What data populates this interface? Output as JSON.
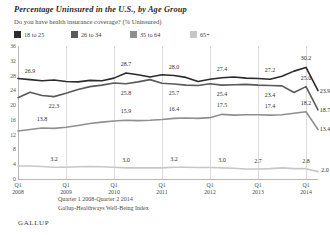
{
  "chart_data": {
    "type": "line",
    "title": "Percentage Uninsured in the U.S., by Age Group",
    "subtitle": "Do you have health insurance coverage? (% Uninsured)",
    "xlabel": "",
    "ylabel": "",
    "ylim": [
      0,
      36
    ],
    "yticks": [
      0,
      4,
      8,
      12,
      16,
      20,
      24,
      28,
      32,
      36
    ],
    "grid": "vertical",
    "legend_position": "top-left",
    "x": [
      "Q1 2008",
      "Q2 2008",
      "Q3 2008",
      "Q4 2008",
      "Q1 2009",
      "Q2 2009",
      "Q3 2009",
      "Q4 2009",
      "Q1 2010",
      "Q2 2010",
      "Q3 2010",
      "Q4 2010",
      "Q1 2011",
      "Q2 2011",
      "Q3 2011",
      "Q4 2011",
      "Q1 2012",
      "Q2 2012",
      "Q3 2012",
      "Q4 2012",
      "Q1 2013",
      "Q2 2013",
      "Q3 2013",
      "Q4 2013",
      "Q1 2014",
      "Q2 2014"
    ],
    "xtick_labels": [
      {
        "q": "Q1",
        "year": "2008"
      },
      {
        "q": "Q1",
        "year": "2009"
      },
      {
        "q": "Q1",
        "year": "2010"
      },
      {
        "q": "Q1",
        "year": "2011"
      },
      {
        "q": "Q1",
        "year": "2012"
      },
      {
        "q": "Q1",
        "year": "2013"
      },
      {
        "q": "Q1",
        "year": "2014"
      }
    ],
    "series": [
      {
        "name": "18 to 25",
        "color": "#2b2b2b",
        "values": [
          27.2,
          26.9,
          26.6,
          26.8,
          26.4,
          26.3,
          26.7,
          26.6,
          27.3,
          28.7,
          28.2,
          27.6,
          28.2,
          28.0,
          27.5,
          26.4,
          27.0,
          27.4,
          27.6,
          27.3,
          27.2,
          27.0,
          27.8,
          29.2,
          30.2,
          23.9
        ]
      },
      {
        "name": "26 to 34",
        "color": "#5a5a5a",
        "values": [
          22.0,
          23.5,
          22.6,
          22.3,
          23.2,
          24.2,
          25.0,
          25.4,
          26.0,
          25.8,
          26.3,
          26.9,
          25.9,
          25.7,
          25.4,
          25.3,
          25.8,
          25.4,
          25.5,
          25.6,
          25.4,
          25.3,
          25.2,
          23.4,
          25.0,
          18.7
        ]
      },
      {
        "name": "35 to 64",
        "color": "#8f8f8f",
        "values": [
          13.0,
          13.4,
          13.8,
          13.7,
          14.0,
          14.5,
          15.0,
          15.4,
          15.7,
          15.9,
          15.8,
          15.9,
          16.1,
          16.4,
          16.5,
          16.4,
          16.6,
          17.5,
          17.3,
          17.4,
          17.4,
          17.3,
          17.4,
          17.8,
          18.2,
          13.4
        ]
      },
      {
        "name": "65+",
        "color": "#c7c7c7",
        "values": [
          3.5,
          3.5,
          3.4,
          3.2,
          3.2,
          3.3,
          3.4,
          3.3,
          3.2,
          3.0,
          3.0,
          3.0,
          3.0,
          3.2,
          3.2,
          3.1,
          3.1,
          3.0,
          2.9,
          2.7,
          2.7,
          2.8,
          3.0,
          2.8,
          2.8,
          2.0
        ]
      }
    ],
    "point_labels": [
      {
        "series": "18 to 25",
        "index": 1,
        "value": "26.9",
        "dx": 0,
        "dy": -9
      },
      {
        "series": "18 to 25",
        "index": 9,
        "value": "28.7",
        "dx": 0,
        "dy": -9
      },
      {
        "series": "18 to 25",
        "index": 13,
        "value": "28.0",
        "dx": 0,
        "dy": -9
      },
      {
        "series": "18 to 25",
        "index": 17,
        "value": "27.4",
        "dx": 0,
        "dy": -9
      },
      {
        "series": "18 to 25",
        "index": 21,
        "value": "27.2",
        "dx": 0,
        "dy": -9
      },
      {
        "series": "18 to 25",
        "index": 24,
        "value": "30.2",
        "dx": 0,
        "dy": -9
      },
      {
        "series": "18 to 25",
        "index": 25,
        "value": "23.9",
        "dx": 7,
        "dy": 0
      },
      {
        "series": "26 to 34",
        "index": 3,
        "value": "22.3",
        "dx": 0,
        "dy": 9
      },
      {
        "series": "26 to 34",
        "index": 9,
        "value": "25.8",
        "dx": 0,
        "dy": 9
      },
      {
        "series": "26 to 34",
        "index": 13,
        "value": "25.7",
        "dx": 0,
        "dy": 9
      },
      {
        "series": "26 to 34",
        "index": 17,
        "value": "25.4",
        "dx": 0,
        "dy": 9
      },
      {
        "series": "26 to 34",
        "index": 21,
        "value": "23.4",
        "dx": 0,
        "dy": 9
      },
      {
        "series": "26 to 34",
        "index": 24,
        "value": "25.0",
        "dx": 0,
        "dy": -9
      },
      {
        "series": "26 to 34",
        "index": 25,
        "value": "18.7",
        "dx": 7,
        "dy": 0
      },
      {
        "series": "35 to 64",
        "index": 2,
        "value": "13.8",
        "dx": 0,
        "dy": -9
      },
      {
        "series": "35 to 64",
        "index": 9,
        "value": "15.9",
        "dx": 0,
        "dy": -9
      },
      {
        "series": "35 to 64",
        "index": 13,
        "value": "16.4",
        "dx": 0,
        "dy": -9
      },
      {
        "series": "35 to 64",
        "index": 17,
        "value": "17.5",
        "dx": 0,
        "dy": -9
      },
      {
        "series": "35 to 64",
        "index": 21,
        "value": "17.4",
        "dx": 0,
        "dy": -9
      },
      {
        "series": "35 to 64",
        "index": 24,
        "value": "18.2",
        "dx": 0,
        "dy": -9
      },
      {
        "series": "35 to 64",
        "index": 25,
        "value": "13.4",
        "dx": 7,
        "dy": 0
      },
      {
        "series": "65+",
        "index": 3,
        "value": "3.2",
        "dx": 0,
        "dy": -8
      },
      {
        "series": "65+",
        "index": 9,
        "value": "3.0",
        "dx": 0,
        "dy": -8
      },
      {
        "series": "65+",
        "index": 13,
        "value": "3.2",
        "dx": 0,
        "dy": -8
      },
      {
        "series": "65+",
        "index": 17,
        "value": "3.0",
        "dx": 0,
        "dy": -8
      },
      {
        "series": "65+",
        "index": 20,
        "value": "2.7",
        "dx": 0,
        "dy": -8
      },
      {
        "series": "65+",
        "index": 24,
        "value": "2.8",
        "dx": 0,
        "dy": -8
      },
      {
        "series": "65+",
        "index": 25,
        "value": "2.0",
        "dx": 7,
        "dy": -2
      }
    ]
  },
  "footer": {
    "line1": "Quarter 1 2008-Quarter 2 2014",
    "line2": "Gallup-Healthways Well-Being Index",
    "brand": "GALLUP"
  }
}
